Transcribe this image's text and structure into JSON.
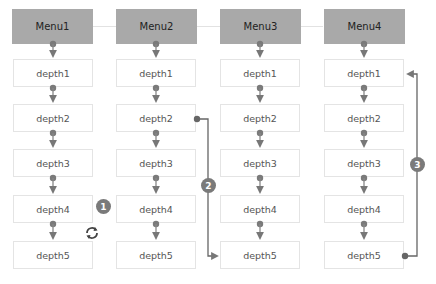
{
  "columns": [
    {
      "header": "Menu1",
      "items": [
        "depth1",
        "depth2",
        "depth3",
        "depth4",
        "depth5"
      ]
    },
    {
      "header": "Menu2",
      "items": [
        "depth1",
        "depth2",
        "depth3",
        "depth4",
        "depth5"
      ]
    },
    {
      "header": "Menu3",
      "items": [
        "depth1",
        "depth2",
        "depth3",
        "depth4",
        "depth5"
      ]
    },
    {
      "header": "Menu4",
      "items": [
        "depth1",
        "depth2",
        "depth3",
        "depth4",
        "depth5"
      ]
    }
  ],
  "annotations": [
    {
      "badge": "1",
      "icon": "refresh-icon"
    },
    {
      "badge": "2"
    },
    {
      "badge": "3"
    }
  ],
  "colors": {
    "header": "#a9a9a9",
    "connector": "#777777",
    "dot": "#6f6f6f",
    "badge": "#7a7a7a"
  }
}
